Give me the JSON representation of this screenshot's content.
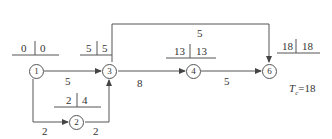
{
  "diagram": {
    "type": "network-diagram (activity-on-arrow, critical path)",
    "total_duration_label": "T",
    "total_duration_sub": "c",
    "total_duration_eq": "=18",
    "nodes": [
      {
        "id": "1",
        "label": "1",
        "time_label": {
          "left": "0",
          "right": "0"
        }
      },
      {
        "id": "2",
        "label": "2",
        "time_label": {
          "left": "2",
          "right": "4"
        }
      },
      {
        "id": "3",
        "label": "3",
        "time_label": {
          "left": "5",
          "right": "5"
        }
      },
      {
        "id": "4",
        "label": "4",
        "time_label": {
          "left": "13",
          "right": "13"
        }
      },
      {
        "id": "6",
        "label": "6",
        "time_label": {
          "left": "18",
          "right": "18"
        }
      }
    ],
    "edges": [
      {
        "from": "1",
        "to": "3",
        "duration": "5"
      },
      {
        "from": "1",
        "to": "2",
        "duration": "2"
      },
      {
        "from": "2",
        "to": "3",
        "duration": "2"
      },
      {
        "from": "3",
        "to": "4",
        "duration": "8"
      },
      {
        "from": "4",
        "to": "6",
        "duration": "5"
      },
      {
        "from": "3",
        "to": "6",
        "duration": "5"
      }
    ]
  }
}
